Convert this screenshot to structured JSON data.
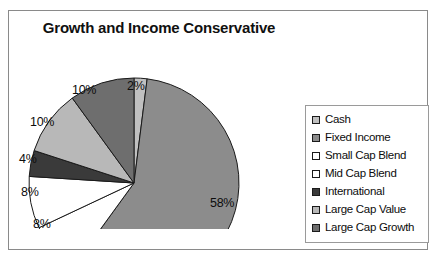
{
  "chart_data": {
    "type": "pie",
    "title": "Growth and Income Conservative",
    "categories": [
      "Cash",
      "Fixed Income",
      "Small Cap Blend",
      "Mid Cap Blend",
      "International",
      "Large Cap Value",
      "Large Cap Growth"
    ],
    "values": [
      2,
      58,
      8,
      8,
      4,
      10,
      10
    ],
    "value_labels": [
      "2%",
      "58%",
      "8%",
      "8%",
      "4%",
      "10%",
      "10%"
    ],
    "colors": [
      "#c0c0c0",
      "#8c8c8c",
      "#ffffff",
      "#ffffff",
      "#3a3a3a",
      "#b8b8b8",
      "#6e6e6e"
    ],
    "legend_position": "right",
    "grid": false,
    "xlabel": "",
    "ylabel": "",
    "start_angle_deg": 0,
    "direction": "clockwise",
    "slices": [
      {
        "label": "Cash",
        "value": 2,
        "display": "2%",
        "color": "#c0c0c0"
      },
      {
        "label": "Fixed Income",
        "value": 58,
        "display": "58%",
        "color": "#8c8c8c"
      },
      {
        "label": "Small Cap Blend",
        "value": 8,
        "display": "8%",
        "color": "#ffffff"
      },
      {
        "label": "Mid Cap Blend",
        "value": 8,
        "display": "8%",
        "color": "#ffffff"
      },
      {
        "label": "International",
        "value": 4,
        "display": "4%",
        "color": "#3a3a3a"
      },
      {
        "label": "Large Cap Value",
        "value": 10,
        "display": "10%",
        "color": "#b8b8b8"
      },
      {
        "label": "Large Cap Growth",
        "value": 10,
        "display": "10%",
        "color": "#6e6e6e"
      }
    ]
  },
  "labels": {
    "cash": "2%",
    "fixed_income": "58%",
    "small_cap_blend": "8%",
    "mid_cap_blend": "8%",
    "international": "4%",
    "large_cap_value": "10%",
    "large_cap_growth": "10%"
  },
  "legend": {
    "items": [
      {
        "label": "Cash",
        "color": "#c0c0c0"
      },
      {
        "label": "Fixed Income",
        "color": "#8c8c8c"
      },
      {
        "label": "Small Cap Blend",
        "color": "#ffffff"
      },
      {
        "label": "Mid Cap Blend",
        "color": "#ffffff"
      },
      {
        "label": "International",
        "color": "#3a3a3a"
      },
      {
        "label": "Large Cap Value",
        "color": "#b8b8b8"
      },
      {
        "label": "Large Cap Growth",
        "color": "#6e6e6e"
      }
    ]
  }
}
